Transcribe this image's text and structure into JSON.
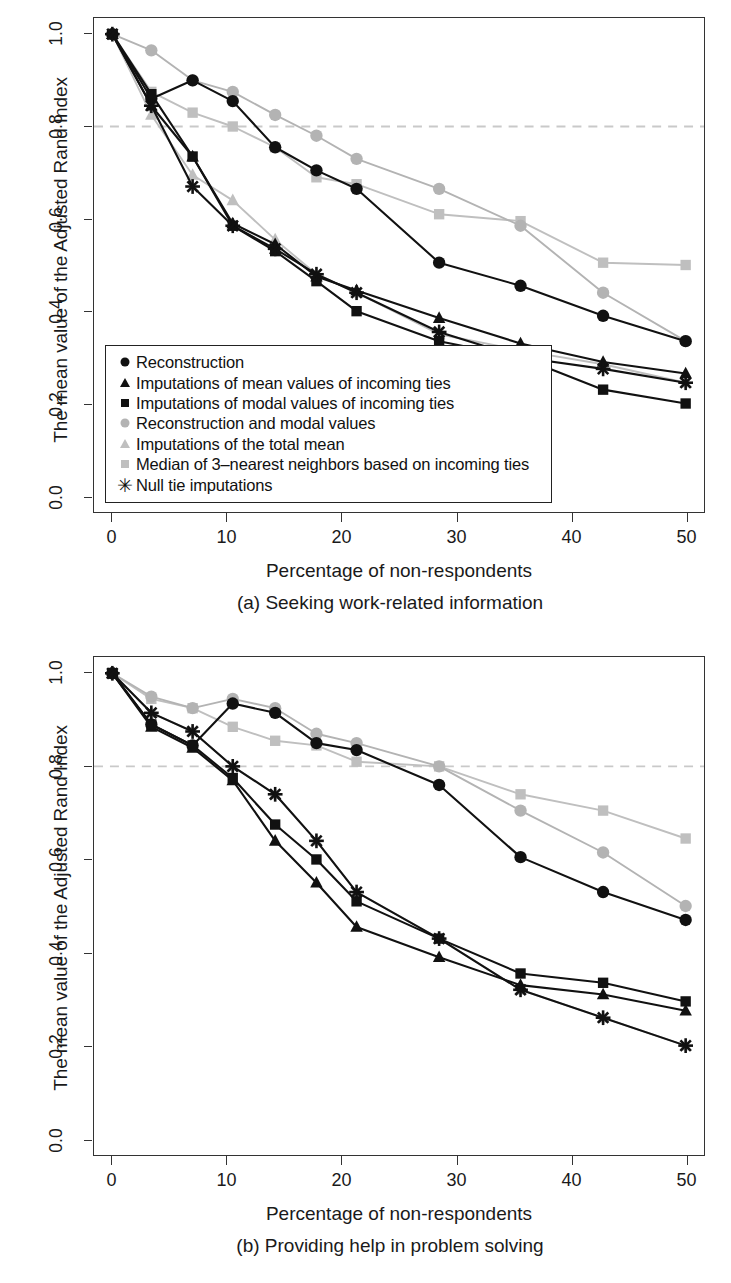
{
  "figure": {
    "y_axis_title": "The mean value of the Adjusted Rand Index",
    "x_axis_title": "Percentage of non-respondents",
    "caption_a": "(a) Seeking work-related information",
    "caption_b": "(b) Providing help in problem solving"
  },
  "colors": {
    "black": "#111111",
    "gray": "#b3b3b3",
    "gray_light": "#bfbfbf",
    "refline": "#c9c9c9",
    "frame": "#333333",
    "background": "#ffffff"
  },
  "legend": {
    "items": [
      {
        "label": "Reconstruction",
        "marker": "circle",
        "color": "#111111",
        "key": "circle-marker-black"
      },
      {
        "label": "Imputations of mean values of incoming ties",
        "marker": "triangle",
        "color": "#111111",
        "key": "triangle-marker-black"
      },
      {
        "label": "Imputations of modal values of incoming ties",
        "marker": "square",
        "color": "#111111",
        "key": "square-marker-black"
      },
      {
        "label": "Reconstruction and modal values",
        "marker": "circle",
        "color": "#b3b3b3",
        "key": "circle-marker-gray"
      },
      {
        "label": "Imputations of the total mean",
        "marker": "triangle",
        "color": "#bfbfbf",
        "key": "triangle-marker-gray"
      },
      {
        "label": "Median of 3–nearest neighbors based on incoming ties",
        "marker": "square",
        "color": "#bfbfbf",
        "key": "square-marker-gray"
      },
      {
        "label": "Null tie imputations",
        "marker": "asterisk",
        "color": "#111111",
        "key": "asterisk-marker-black"
      }
    ]
  },
  "axes": {
    "x_ticks": [
      "0",
      "10",
      "20",
      "30",
      "40",
      "50"
    ],
    "x_tick_values": [
      0,
      10,
      20,
      30,
      40,
      50
    ],
    "y_ticks": [
      "0.0",
      "0.2",
      "0.4",
      "0.6",
      "0.8",
      "1.0"
    ],
    "y_tick_values": [
      0.0,
      0.2,
      0.4,
      0.6,
      0.8,
      1.0
    ],
    "xlim": [
      -1.6,
      51.6
    ],
    "ylim": [
      -0.035,
      1.035
    ],
    "reference_line_y": 0.8,
    "grid": false
  },
  "chart_data": [
    {
      "id": "chart-a",
      "type": "line",
      "title": "(a) Seeking work-related information",
      "xlabel": "Percentage of non-respondents",
      "ylabel": "The mean value of the Adjusted Rand Index",
      "xlim": [
        -1.6,
        51.6
      ],
      "ylim": [
        -0.035,
        1.035
      ],
      "grid": false,
      "legend_position": "inside-bottom-left",
      "reference_line": {
        "y": 0.8,
        "style": "dashed",
        "color": "#c9c9c9"
      },
      "x": [
        0,
        3.4,
        7.0,
        10.5,
        14.2,
        17.8,
        21.3,
        28.5,
        35.6,
        42.8,
        50.0
      ],
      "series": [
        {
          "name": "Reconstruction",
          "marker": "circle",
          "color": "#111111",
          "values": [
            1.0,
            0.86,
            0.9,
            0.855,
            0.755,
            0.705,
            0.665,
            0.505,
            0.455,
            0.39,
            0.335
          ]
        },
        {
          "name": "Imputations of mean values of incoming ties",
          "marker": "triangle",
          "color": "#111111",
          "values": [
            1.0,
            0.845,
            0.735,
            0.59,
            0.545,
            0.475,
            0.445,
            0.385,
            0.33,
            0.29,
            0.265
          ]
        },
        {
          "name": "Imputations of modal values of incoming ties",
          "marker": "square",
          "color": "#111111",
          "values": [
            1.0,
            0.87,
            0.735,
            0.585,
            0.53,
            0.465,
            0.4,
            0.335,
            0.3,
            0.23,
            0.2
          ]
        },
        {
          "name": "Reconstruction and modal values",
          "marker": "circle",
          "color": "#b3b3b3",
          "values": [
            1.0,
            0.965,
            0.9,
            0.875,
            0.825,
            0.78,
            0.73,
            0.665,
            0.585,
            0.44,
            0.335
          ]
        },
        {
          "name": "Imputations of the total mean",
          "marker": "triangle",
          "color": "#bfbfbf",
          "values": [
            1.0,
            0.825,
            0.695,
            0.64,
            0.555,
            0.48,
            0.44,
            0.35,
            0.315,
            0.285,
            0.245
          ]
        },
        {
          "name": "Median of 3–nearest neighbors based on incoming ties",
          "marker": "square",
          "color": "#bfbfbf",
          "values": [
            1.0,
            0.875,
            0.83,
            0.8,
            0.755,
            0.69,
            0.675,
            0.61,
            0.595,
            0.505,
            0.5
          ]
        },
        {
          "name": "Null tie imputations",
          "marker": "asterisk",
          "color": "#111111",
          "values": [
            1.0,
            0.845,
            0.67,
            0.585,
            0.535,
            0.48,
            0.44,
            0.355,
            0.3,
            0.275,
            0.245
          ]
        }
      ]
    },
    {
      "id": "chart-b",
      "type": "line",
      "title": "(b) Providing help in problem solving",
      "xlabel": "Percentage of non-respondents",
      "ylabel": "The mean value of the Adjusted Rand Index",
      "xlim": [
        -1.6,
        51.6
      ],
      "ylim": [
        -0.035,
        1.035
      ],
      "grid": false,
      "legend_position": "inside-bottom-left",
      "reference_line": {
        "y": 0.8,
        "style": "dashed",
        "color": "#c9c9c9"
      },
      "x": [
        0,
        3.4,
        7.0,
        10.5,
        14.2,
        17.8,
        21.3,
        28.5,
        35.6,
        42.8,
        50.0
      ],
      "series": [
        {
          "name": "Reconstruction",
          "marker": "circle",
          "color": "#111111",
          "values": [
            1.0,
            0.89,
            0.845,
            0.935,
            0.915,
            0.85,
            0.835,
            0.76,
            0.605,
            0.53,
            0.47
          ]
        },
        {
          "name": "Imputations of mean values of incoming ties",
          "marker": "triangle",
          "color": "#111111",
          "values": [
            1.0,
            0.885,
            0.84,
            0.77,
            0.64,
            0.55,
            0.455,
            0.39,
            0.33,
            0.31,
            0.275
          ]
        },
        {
          "name": "Imputations of modal values of incoming ties",
          "marker": "square",
          "color": "#111111",
          "values": [
            1.0,
            0.89,
            0.845,
            0.775,
            0.675,
            0.6,
            0.51,
            0.43,
            0.355,
            0.335,
            0.295
          ]
        },
        {
          "name": "Reconstruction and modal values",
          "marker": "circle",
          "color": "#b3b3b3",
          "values": [
            1.0,
            0.95,
            0.925,
            0.945,
            0.925,
            0.87,
            0.85,
            0.8,
            0.705,
            0.615,
            0.5
          ]
        },
        {
          "name": "Imputations of the total mean",
          "marker": "triangle",
          "color": "#bfbfbf",
          "values": [
            1.0,
            0.915,
            0.875,
            0.8,
            0.74,
            0.64,
            0.53,
            0.43,
            0.32,
            0.26,
            0.2
          ]
        },
        {
          "name": "Median of 3–nearest neighbors based on incoming ties",
          "marker": "square",
          "color": "#bfbfbf",
          "values": [
            1.0,
            0.945,
            0.925,
            0.885,
            0.855,
            0.845,
            0.81,
            0.8,
            0.74,
            0.705,
            0.645
          ]
        },
        {
          "name": "Null tie imputations",
          "marker": "asterisk",
          "color": "#111111",
          "values": [
            1.0,
            0.915,
            0.875,
            0.8,
            0.74,
            0.64,
            0.53,
            0.43,
            0.32,
            0.26,
            0.2
          ]
        }
      ]
    }
  ]
}
